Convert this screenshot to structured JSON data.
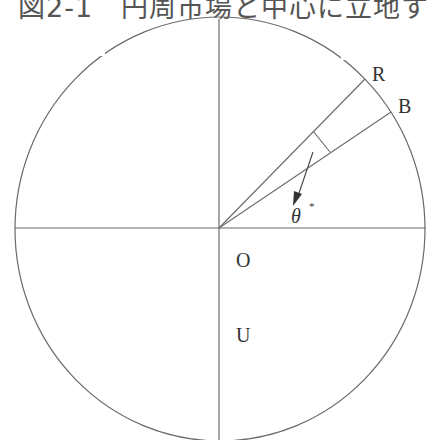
{
  "title": "図2-1　円周市場と中心に立地する生産経営",
  "labels": {
    "R": "R",
    "B": "B",
    "theta": "θ",
    "theta_mark": "*",
    "O": "O",
    "U": "U"
  },
  "colors": {
    "line": "#6a6a6a",
    "text": "#333333"
  }
}
